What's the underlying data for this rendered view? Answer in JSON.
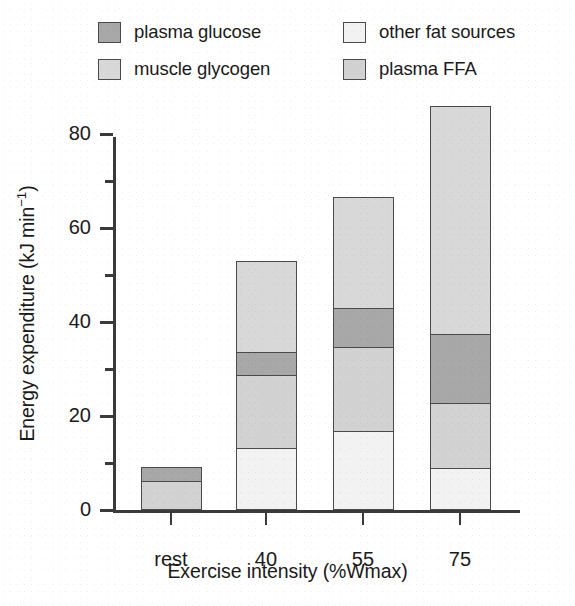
{
  "chart_data": {
    "type": "bar",
    "subtype": "stacked",
    "title": "",
    "xlabel": "Exercise intensity (%Wmax)",
    "ylabel": "Energy expenditure (kJ min-1)",
    "ylabel_parts": {
      "text": "Energy expenditure (kJ min",
      "sup": "−1",
      "tail": ")"
    },
    "categories": [
      "rest",
      "40",
      "55",
      "75"
    ],
    "ylim": [
      0,
      88
    ],
    "yticks_major": [
      0,
      20,
      40,
      60,
      80
    ],
    "yticks_minor": [
      10,
      30,
      50,
      70
    ],
    "ytick_labels": [
      "0",
      "20",
      "40",
      "60",
      "80"
    ],
    "grid": false,
    "legend_position": "top",
    "stack_order_bottom_to_top": [
      "other fat sources",
      "plasma FFA",
      "plasma glucose",
      "muscle glycogen"
    ],
    "series": [
      {
        "name": "other fat sources",
        "color": "#f2f2f2",
        "values": [
          0.0,
          13.0,
          16.7,
          8.8
        ]
      },
      {
        "name": "plasma FFA",
        "color": "#d2d2d2",
        "values": [
          6.0,
          15.6,
          17.8,
          13.9
        ]
      },
      {
        "name": "plasma glucose",
        "color": "#a8a8a8",
        "values": [
          2.8,
          5.0,
          8.4,
          14.6
        ]
      },
      {
        "name": "muscle glycogen",
        "color": "#d8d8d8",
        "values": [
          0.0,
          19.0,
          23.4,
          48.3
        ]
      }
    ],
    "cumulative_tops": {
      "rest": [
        0.0,
        6.0,
        8.8,
        8.8
      ],
      "40": [
        13.0,
        28.6,
        33.6,
        52.6
      ],
      "55": [
        16.7,
        34.5,
        42.9,
        66.3
      ],
      "75": [
        8.8,
        22.7,
        37.3,
        85.6
      ]
    },
    "totals": [
      8.8,
      52.6,
      66.3,
      85.6
    ]
  },
  "legend": {
    "items": [
      {
        "label": "plasma glucose",
        "color": "#a8a8a8"
      },
      {
        "label": "muscle glycogen",
        "color": "#d8d8d8"
      },
      {
        "label": "other fat sources",
        "color": "#f2f2f2"
      },
      {
        "label": "plasma FFA",
        "color": "#d2d2d2"
      }
    ]
  },
  "style": {
    "axis_color": "#3a3a3a",
    "bar_edge_color": "#4a4a4a",
    "background": "#ffffff"
  }
}
